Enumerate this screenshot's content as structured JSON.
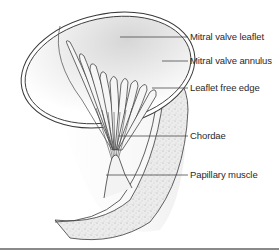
{
  "figure": {
    "labels": [
      {
        "id": "mitral-valve-leaflet",
        "text": "Mitral valve leaflet",
        "x": 190,
        "y": 30,
        "line_from": [
          120,
          37
        ],
        "line_to": [
          188,
          37
        ]
      },
      {
        "id": "mitral-valve-annulus",
        "text": "Mitral valve annulus",
        "x": 190,
        "y": 55,
        "line_from": [
          162,
          61
        ],
        "line_to": [
          188,
          61
        ]
      },
      {
        "id": "leaflet-free-edge",
        "text": "Leaflet free edge",
        "x": 190,
        "y": 83,
        "line_from": [
          160,
          88
        ],
        "line_to": [
          188,
          88
        ]
      },
      {
        "id": "chordae",
        "text": "Chordae",
        "x": 190,
        "y": 132,
        "line_from": [
          118,
          136
        ],
        "line_to": [
          188,
          136
        ]
      },
      {
        "id": "papillary-muscle",
        "text": "Papillary muscle",
        "x": 190,
        "y": 170,
        "line_from": [
          106,
          175
        ],
        "line_to": [
          188,
          175
        ]
      }
    ],
    "colors": {
      "outline": "#3a3a3a",
      "leader_line": "#4a4a4a",
      "label_text": "#2a2a2a",
      "myocardium_fill": "#e4e4e4",
      "leaflet_shade": "#dcdcdc",
      "background": "#ffffff",
      "bottom_rule": "#8a8a8a"
    }
  }
}
